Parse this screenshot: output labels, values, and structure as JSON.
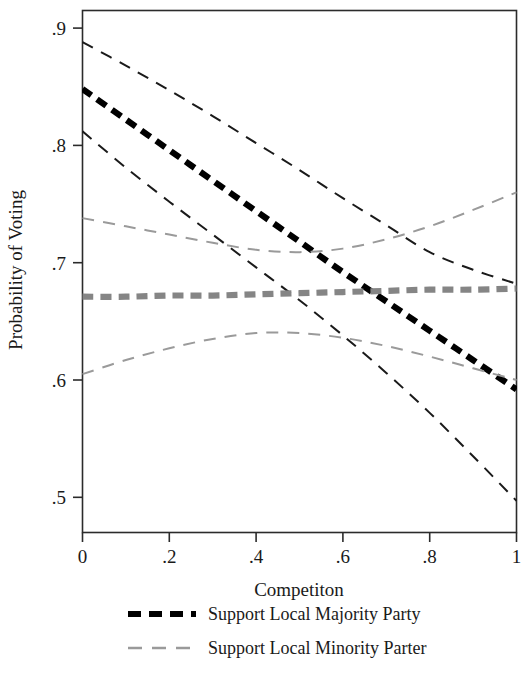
{
  "chart_data": {
    "type": "line",
    "title": "",
    "xlabel": "Competiton",
    "ylabel": "Probability of Voting",
    "xlim": [
      0,
      1
    ],
    "ylim": [
      0.47,
      0.915
    ],
    "grid": false,
    "legend_position": "bottom",
    "xticks": [
      "0",
      ".2",
      ".4",
      ".6",
      ".8",
      "1"
    ],
    "xtick_values": [
      0,
      0.2,
      0.4,
      0.6,
      0.8,
      1
    ],
    "yticks": [
      ".9",
      ".8",
      ".7",
      ".6",
      ".5"
    ],
    "ytick_values": [
      0.9,
      0.8,
      0.7,
      0.6,
      0.5
    ],
    "x": [
      0,
      0.1,
      0.2,
      0.3,
      0.4,
      0.5,
      0.6,
      0.7,
      0.8,
      0.9,
      1
    ],
    "series": [
      {
        "name": "Support Local Majority Party",
        "role": "estimate",
        "color": "#000000",
        "style": "dashed-thick",
        "values": [
          0.848,
          0.822,
          0.796,
          0.77,
          0.744,
          0.718,
          0.692,
          0.667,
          0.642,
          0.617,
          0.592
        ]
      },
      {
        "name": "Support Local Majority Party upper CI",
        "role": "upper-ci",
        "color": "#1a1a1a",
        "style": "dashed-thin",
        "values": [
          0.888,
          0.868,
          0.847,
          0.825,
          0.802,
          0.779,
          0.755,
          0.732,
          0.709,
          0.694,
          0.682
        ]
      },
      {
        "name": "Support Local Majority Party lower CI",
        "role": "lower-ci",
        "color": "#1a1a1a",
        "style": "dashed-thin",
        "values": [
          0.812,
          0.781,
          0.752,
          0.724,
          0.696,
          0.668,
          0.638,
          0.606,
          0.572,
          0.535,
          0.497
        ]
      },
      {
        "name": "Support Local Minority Parter",
        "role": "estimate",
        "color": "#858585",
        "style": "dashed-thick",
        "values": [
          0.671,
          0.671,
          0.672,
          0.672,
          0.673,
          0.674,
          0.675,
          0.676,
          0.677,
          0.677,
          0.678
        ]
      },
      {
        "name": "Support Local Minority Parter upper CI",
        "role": "upper-ci",
        "color": "#9a9a9a",
        "style": "dashed-thin",
        "values": [
          0.738,
          0.731,
          0.724,
          0.717,
          0.711,
          0.709,
          0.712,
          0.72,
          0.731,
          0.745,
          0.76
        ]
      },
      {
        "name": "Support Local Minority Parter lower CI",
        "role": "lower-ci",
        "color": "#9a9a9a",
        "style": "dashed-thin",
        "values": [
          0.605,
          0.617,
          0.627,
          0.635,
          0.64,
          0.64,
          0.636,
          0.629,
          0.62,
          0.61,
          0.6
        ]
      }
    ]
  },
  "axes": {
    "x_title": "Competiton",
    "y_title": "Probability of Voting",
    "x_tick_labels": [
      "0",
      ".2",
      ".4",
      ".6",
      ".8",
      "1"
    ],
    "y_tick_labels": [
      ".9",
      ".8",
      ".7",
      ".6",
      ".5"
    ]
  },
  "legend": {
    "entries": [
      {
        "label": "Support Local Majority Party",
        "color": "#000000",
        "weight": "thick"
      },
      {
        "label": "Support Local Minority Parter",
        "color": "#9a9a9a",
        "weight": "thin"
      }
    ]
  },
  "colors": {
    "majority": "#000000",
    "minority": "#9a9a9a",
    "axis": "#2b2b2b",
    "background": "#ffffff"
  }
}
